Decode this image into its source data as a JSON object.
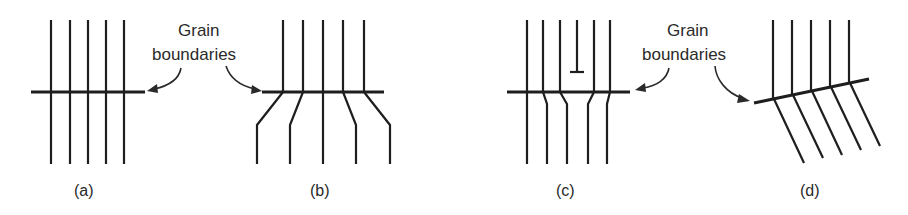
{
  "figure": {
    "labels": {
      "left_callout_line1": "Grain",
      "left_callout_line2": "boundaries",
      "right_callout_line1": "Grain",
      "right_callout_line2": "boundaries"
    },
    "panels": [
      {
        "id": "a",
        "caption": "(a)",
        "description": "Low-angle-free tilt: five parallel lattice planes continuous across a horizontal grain boundary"
      },
      {
        "id": "b",
        "caption": "(b)",
        "description": "Lattice planes bend at the grain boundary and spread apart below it"
      },
      {
        "id": "c",
        "caption": "(c)",
        "description": "Extra half-plane (edge dislocation) terminating above the boundary; planes shift below"
      },
      {
        "id": "d",
        "caption": "(d)",
        "description": "Inclined grain boundary with lattice planes tilted below the boundary"
      }
    ],
    "colors": {
      "line": "#1e1e1e",
      "text": "#2a2a2a",
      "background": "#ffffff"
    }
  }
}
